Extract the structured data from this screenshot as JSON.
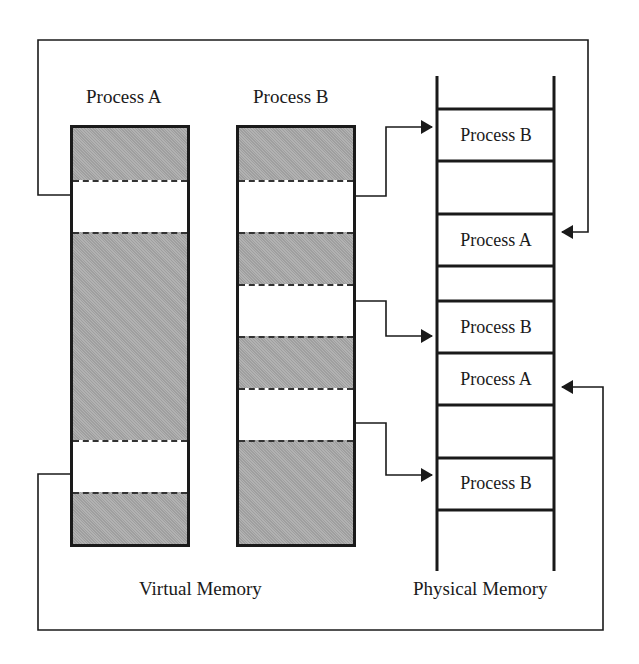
{
  "title_labels": {
    "process_a": "Process A",
    "process_b": "Process B",
    "virtual_memory": "Virtual Memory",
    "physical_memory": "Physical Memory"
  },
  "virtual_memory": {
    "process_a": {
      "segments": [
        {
          "state": "used",
          "top": 0,
          "height": 52
        },
        {
          "state": "free",
          "top": 52,
          "height": 52
        },
        {
          "state": "used",
          "top": 104,
          "height": 208
        },
        {
          "state": "free",
          "top": 312,
          "height": 52
        },
        {
          "state": "used",
          "top": 364,
          "height": 52
        }
      ]
    },
    "process_b": {
      "segments": [
        {
          "state": "used",
          "top": 0,
          "height": 52
        },
        {
          "state": "free",
          "top": 52,
          "height": 52
        },
        {
          "state": "used",
          "top": 104,
          "height": 52
        },
        {
          "state": "free",
          "top": 156,
          "height": 52
        },
        {
          "state": "used",
          "top": 208,
          "height": 52
        },
        {
          "state": "free",
          "top": 260,
          "height": 52
        },
        {
          "state": "used",
          "top": 312,
          "height": 104
        }
      ]
    }
  },
  "physical_memory": {
    "slots": [
      {
        "label": "Process B"
      },
      {
        "label": ""
      },
      {
        "label": "Process A"
      },
      {
        "label": ""
      },
      {
        "label": "Process B"
      },
      {
        "label": "Process A"
      },
      {
        "label": ""
      },
      {
        "label": "Process B"
      }
    ]
  },
  "colors": {
    "line": "#1a1a1a",
    "used_fill": "#a8a8a8",
    "free_fill": "#ffffff",
    "background": "#ffffff"
  }
}
